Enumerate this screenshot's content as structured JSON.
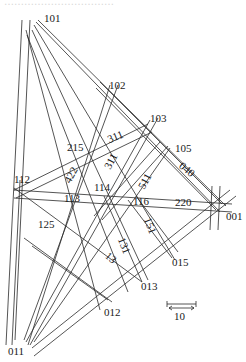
{
  "caption": {
    "text": "……………………………"
  },
  "diagram": {
    "type": "stereographic zone-line projection (indexing map)",
    "stroke_color": "#2a2a2a",
    "pole_labels": [
      {
        "id": "p101",
        "text": "101",
        "x": 44,
        "y": 13
      },
      {
        "id": "p102",
        "text": "102",
        "x": 109,
        "y": 80
      },
      {
        "id": "p103",
        "text": "103",
        "x": 150,
        "y": 113
      },
      {
        "id": "p105",
        "text": "105",
        "x": 175,
        "y": 143
      },
      {
        "id": "p112",
        "text": "112",
        "x": 14,
        "y": 174
      },
      {
        "id": "p113",
        "text": "113",
        "x": 64,
        "y": 193
      },
      {
        "id": "p114",
        "text": "114",
        "x": 94,
        "y": 182
      },
      {
        "id": "p116",
        "text": "116",
        "x": 133,
        "y": 196
      },
      {
        "id": "p220",
        "text": "220",
        "x": 175,
        "y": 197
      },
      {
        "id": "p001",
        "text": "001",
        "x": 226,
        "y": 211
      },
      {
        "id": "p125",
        "text": "125",
        "x": 38,
        "y": 219
      },
      {
        "id": "p015",
        "text": "015",
        "x": 172,
        "y": 257
      },
      {
        "id": "p013",
        "text": "013",
        "x": 141,
        "y": 281
      },
      {
        "id": "p012",
        "text": "012",
        "x": 104,
        "y": 307
      },
      {
        "id": "p011",
        "text": "011",
        "x": 8,
        "y": 346
      }
    ],
    "zone_labels": [
      {
        "id": "z311a",
        "text": "311",
        "x": 112,
        "y": 144,
        "rot": -40
      },
      {
        "id": "z311b",
        "text": "311",
        "x": 116,
        "y": 165,
        "rot": -62
      },
      {
        "id": "z215",
        "text": "215",
        "x": 67,
        "y": 142,
        "rot": 0
      },
      {
        "id": "z422",
        "text": "422",
        "x": 74,
        "y": 176,
        "rot": -62
      },
      {
        "id": "z511",
        "text": "511",
        "x": 148,
        "y": 182,
        "rot": -62
      },
      {
        "id": "z040",
        "text": "040",
        "x": 182,
        "y": 162,
        "rot": 40
      },
      {
        "id": "z151",
        "text": "151",
        "x": 150,
        "y": 220,
        "rot": 68
      },
      {
        "id": "z131",
        "text": "131",
        "x": 123,
        "y": 238,
        "rot": 68
      },
      {
        "id": "z13",
        "text": "13",
        "x": 110,
        "y": 252,
        "rot": 30
      }
    ],
    "scale_bar": {
      "label": "10",
      "x1": 167,
      "x2": 196,
      "y": 306
    }
  }
}
